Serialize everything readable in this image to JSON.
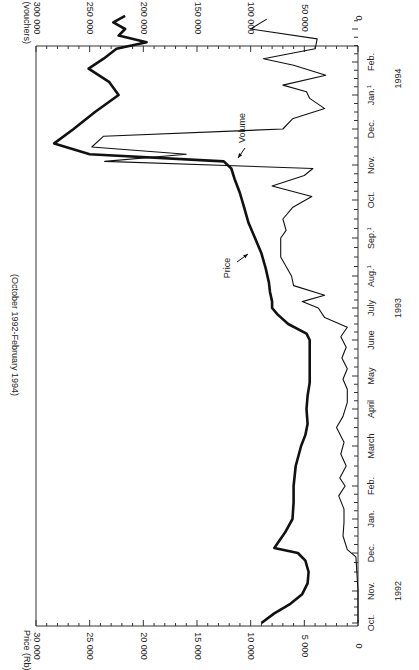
{
  "chart_data": {
    "type": "line",
    "title": "",
    "subtitle": "(October 1992-February 1994)",
    "orientation": "rotated-90 (time axis vertical on right, Oct 1992 at bottom)",
    "xlabel": "",
    "x_tick_labels": [
      "Oct.",
      "Nov.",
      "Dec.",
      "Jan.",
      "Feb.",
      "March",
      "April",
      "May",
      "June",
      "July",
      "Aug.",
      "Sep.",
      "Oct.",
      "Nov.",
      "Dec.",
      "Jan.",
      "Feb."
    ],
    "x_tick_superscripts": {
      "10": "1",
      "11": "1",
      "15": "1"
    },
    "year_labels": [
      {
        "label": "1992",
        "at_month": 1
      },
      {
        "label": "1993",
        "at_month": 9
      },
      {
        "label": "1994",
        "at_month": 15.5
      }
    ],
    "y_left": {
      "label": "Price (Rb)",
      "ticks": [
        "0",
        "5 000",
        "10 000",
        "15 000",
        "20 000",
        "25 000",
        "30 000"
      ],
      "range": [
        0,
        30000
      ]
    },
    "y_right": {
      "label": "Average daily volume (vouchers)",
      "ticks": [
        "0",
        "50 000",
        "100 000",
        "150 000",
        "200 000",
        "250 000",
        "300 000"
      ],
      "range": [
        0,
        300000
      ]
    },
    "series": [
      {
        "name": "Price",
        "axis": "left",
        "style": "thick",
        "points": [
          [
            0,
            9000
          ],
          [
            0.3,
            7800
          ],
          [
            0.6,
            6300
          ],
          [
            0.9,
            5200
          ],
          [
            1.2,
            4700
          ],
          [
            1.5,
            4600
          ],
          [
            1.8,
            4900
          ],
          [
            2.0,
            5600
          ],
          [
            2.15,
            7800
          ],
          [
            2.6,
            6800
          ],
          [
            3.0,
            6100
          ],
          [
            3.5,
            6000
          ],
          [
            4.0,
            6000
          ],
          [
            4.5,
            5800
          ],
          [
            5.0,
            5300
          ],
          [
            5.3,
            4900
          ],
          [
            5.6,
            4700
          ],
          [
            6.0,
            4800
          ],
          [
            6.4,
            4700
          ],
          [
            6.8,
            4500
          ],
          [
            7.2,
            4500
          ],
          [
            7.6,
            4500
          ],
          [
            8.0,
            4500
          ],
          [
            8.2,
            4800
          ],
          [
            8.5,
            6500
          ],
          [
            8.8,
            7500
          ],
          [
            9.0,
            8000
          ],
          [
            9.2,
            8000
          ],
          [
            9.5,
            8200
          ],
          [
            9.8,
            8300
          ],
          [
            10.2,
            8600
          ],
          [
            10.6,
            9000
          ],
          [
            11.0,
            9600
          ],
          [
            11.4,
            10200
          ],
          [
            11.8,
            10600
          ],
          [
            12.2,
            11000
          ],
          [
            12.6,
            11500
          ],
          [
            12.9,
            11800
          ],
          [
            13.1,
            12500
          ],
          [
            13.3,
            25000
          ],
          [
            13.6,
            28300
          ],
          [
            14.0,
            26500
          ],
          [
            14.5,
            24500
          ],
          [
            15.0,
            22300
          ],
          [
            15.4,
            23200
          ],
          [
            15.8,
            25100
          ],
          [
            16.1,
            23700
          ],
          [
            16.4,
            22500
          ],
          [
            16.6,
            19700
          ],
          [
            16.8,
            22300
          ],
          [
            17.0,
            21700
          ],
          [
            17.2,
            22800
          ],
          [
            17.4,
            21700
          ]
        ]
      },
      {
        "name": "Volume",
        "axis": "right",
        "style": "thin",
        "points": [
          [
            0,
            0
          ],
          [
            1.0,
            0
          ],
          [
            1.9,
            2000
          ],
          [
            2.1,
            10000
          ],
          [
            2.5,
            14000
          ],
          [
            2.9,
            13000
          ],
          [
            3.3,
            13000
          ],
          [
            3.7,
            18000
          ],
          [
            4.0,
            12000
          ],
          [
            4.2,
            17000
          ],
          [
            4.5,
            11000
          ],
          [
            4.8,
            16000
          ],
          [
            5.1,
            13000
          ],
          [
            5.5,
            20000
          ],
          [
            5.8,
            14000
          ],
          [
            6.2,
            10000
          ],
          [
            6.6,
            10000
          ],
          [
            6.9,
            14000
          ],
          [
            7.2,
            10000
          ],
          [
            7.5,
            15000
          ],
          [
            7.8,
            11000
          ],
          [
            8.1,
            16000
          ],
          [
            8.4,
            10000
          ],
          [
            8.7,
            31000
          ],
          [
            9.0,
            37000
          ],
          [
            9.2,
            52000
          ],
          [
            9.4,
            31000
          ],
          [
            9.7,
            60000
          ],
          [
            10.0,
            62000
          ],
          [
            10.5,
            72000
          ],
          [
            11.0,
            72000
          ],
          [
            11.2,
            67000
          ],
          [
            11.5,
            70000
          ],
          [
            11.8,
            61000
          ],
          [
            12.1,
            43000
          ],
          [
            12.4,
            80000
          ],
          [
            12.7,
            50000
          ],
          [
            12.9,
            42000
          ],
          [
            13.1,
            236000
          ],
          [
            13.3,
            160000
          ],
          [
            13.5,
            248000
          ],
          [
            13.8,
            237000
          ],
          [
            14.0,
            70000
          ],
          [
            14.3,
            61000
          ],
          [
            14.6,
            31000
          ],
          [
            14.9,
            45000
          ],
          [
            15.1,
            48000
          ],
          [
            15.3,
            70000
          ],
          [
            15.6,
            30000
          ],
          [
            15.9,
            60000
          ],
          [
            16.1,
            88000
          ],
          [
            16.4,
            40000
          ],
          [
            16.7,
            38000
          ],
          [
            17.0,
            100000
          ],
          [
            17.3,
            85000
          ]
        ]
      }
    ],
    "annotations": [
      {
        "text": "Price",
        "series": "Price"
      },
      {
        "text": "Volume",
        "series": "Volume"
      }
    ],
    "grid": false,
    "legend": "none (inline annotations with arrows)"
  },
  "labels": {
    "subtitle": "(October 1992-February 1994)",
    "price_axis_title": "Price (Rb)",
    "volume_axis_title": "Average daily volume (vouchers)",
    "price_annotation": "Price",
    "volume_annotation": "Volume"
  }
}
